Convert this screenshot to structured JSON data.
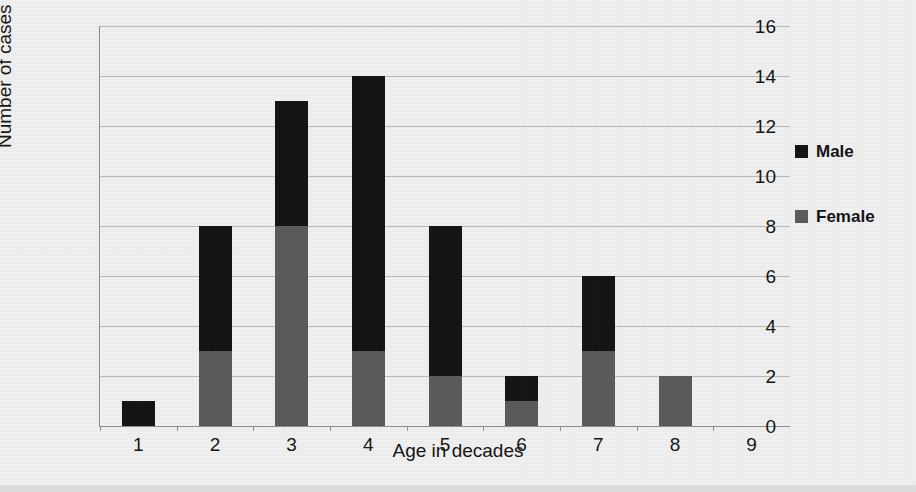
{
  "chart_data": {
    "type": "bar",
    "subtype": "stacked-vertical",
    "title": "",
    "xlabel": "Age in decades",
    "ylabel": "Number of cases",
    "categories": [
      "1",
      "2",
      "3",
      "4",
      "5",
      "6",
      "7",
      "8",
      "9"
    ],
    "series": [
      {
        "name": "Female",
        "color": "#595959",
        "values": [
          0,
          3,
          8,
          3,
          2,
          1,
          3,
          2,
          0
        ]
      },
      {
        "name": "Male",
        "color": "#111111",
        "values": [
          1,
          5,
          5,
          11,
          6,
          1,
          3,
          0,
          0
        ]
      }
    ],
    "totals": [
      1,
      8,
      13,
      14,
      8,
      2,
      6,
      2,
      0
    ],
    "ylim": [
      0,
      16
    ],
    "ytick_labels": [
      "0",
      "2",
      "4",
      "6",
      "8",
      "10",
      "12",
      "14",
      "16"
    ],
    "ytick_values": [
      0,
      2,
      4,
      6,
      8,
      10,
      12,
      14,
      16
    ],
    "xtick_labels": [
      "1",
      "2",
      "3",
      "4",
      "5",
      "6",
      "7",
      "8",
      "9"
    ],
    "grid": "horizontal",
    "legend_position": "right",
    "legend_entries": [
      "Male",
      "Female"
    ]
  },
  "axes": {
    "y_title": "Number of cases",
    "x_title": "Age in decades"
  },
  "legend": {
    "male_label": "Male",
    "female_label": "Female",
    "male_color": "#111111",
    "female_color": "#595959"
  },
  "style": {
    "background": "#f1f1f1",
    "gridline_color": "#b9b9b9",
    "axis_color": "#8d8d8d",
    "text_color": "#131313"
  }
}
